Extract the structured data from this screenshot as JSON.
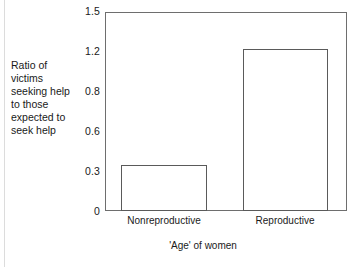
{
  "chart_data": {
    "type": "bar",
    "title": "",
    "subtitle": "",
    "xlabel": "'Age' of women",
    "ylabel": "Ratio of\nvictims\nseeking help\nto those\nexpected to\nseek help",
    "ylabel_lines": [
      "Ratio of",
      "victims",
      "seeking help",
      "to those",
      "expected to",
      "seek help"
    ],
    "categories": [
      "Nonreproductive",
      "Reproductive"
    ],
    "values": [
      0.35,
      1.22
    ],
    "ytick_labels": [
      "1.5",
      "1.2",
      "0.8",
      "0.6",
      "0.3",
      "0"
    ],
    "ytick_values": [
      1.5,
      1.2,
      0.8,
      0.6,
      0.3,
      0
    ],
    "ytick_positions_px": [
      11,
      51,
      91,
      131,
      171,
      211
    ],
    "ylim": [
      0,
      1.5
    ],
    "grid": false,
    "legend": null,
    "legend_position": "none",
    "bar_fill_color": "#ffffff",
    "bar_edge_color": "#5a5a5a",
    "axis_color": "#6e6e6e",
    "text_color": "#1a1a1a",
    "background_color": "#ffffff",
    "annotations": []
  },
  "axis": {
    "y_tick_0": "1.5",
    "y_tick_1": "1.2",
    "y_tick_2": "0.8",
    "y_tick_3": "0.6",
    "y_tick_4": "0.3",
    "y_tick_5": "0",
    "x_cat_0": "Nonreproductive",
    "x_cat_1": "Reproductive",
    "x_title": "'Age' of women",
    "y_title": "Ratio of\nvictims\nseeking help\nto those\nexpected to\nseek help"
  }
}
